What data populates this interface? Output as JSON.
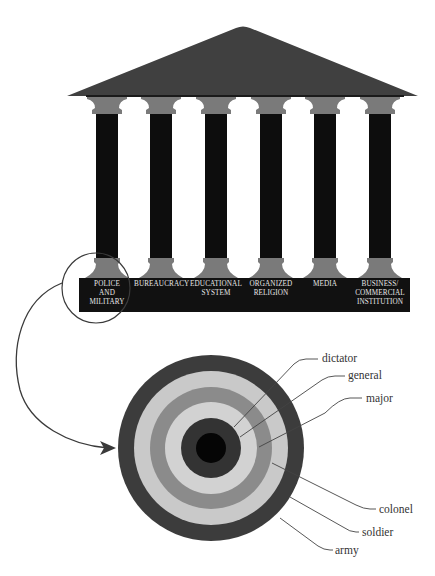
{
  "diagram": {
    "title_cropped": "",
    "temple": {
      "roof_color": "#404040",
      "capital_color": "#7a7a7a",
      "shaft_color": "#0d0d0d",
      "base_color": "#111111",
      "pillars": [
        {
          "label_lines": [
            "POLICE",
            "AND",
            "MILITARY"
          ],
          "highlighted": true
        },
        {
          "label_lines": [
            "BUREAUCRACY"
          ]
        },
        {
          "label_lines": [
            "EDUCATIONAL",
            "SYSTEM"
          ]
        },
        {
          "label_lines": [
            "ORGANIZED",
            "RELIGION"
          ]
        },
        {
          "label_lines": [
            "MEDIA"
          ]
        },
        {
          "label_lines": [
            "BUSINESS/",
            "COMMERCIAL",
            "INSTITUTION"
          ]
        }
      ]
    },
    "target": {
      "rings": [
        {
          "name": "army",
          "color": "#3c3c3c"
        },
        {
          "name": "soldier",
          "color": "#c9c9c9"
        },
        {
          "name": "colonel",
          "color": "#8b8b8b"
        },
        {
          "name": "major",
          "color": "#d2d2d2"
        },
        {
          "name": "general",
          "color": "#333333"
        },
        {
          "name": "dictator",
          "color": "#050505"
        }
      ],
      "labels": {
        "dictator": "dictator",
        "general": "general",
        "major": "major",
        "colonel": "colonel",
        "soldier": "soldier",
        "army": "army"
      }
    },
    "connector": {
      "from": "POLICE AND MILITARY",
      "to": "target"
    }
  }
}
